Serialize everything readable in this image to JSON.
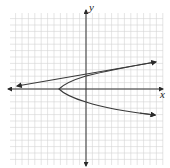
{
  "chart_data": {
    "type": "line",
    "title": "",
    "xlabel": "x",
    "ylabel": "y",
    "grid": true,
    "xlim": [
      -13,
      12
    ],
    "ylim": [
      -12,
      12
    ],
    "series": [
      {
        "name": "parabola",
        "equation": "x = y^2 - 4",
        "vertex": [
          -4,
          0
        ],
        "points": [
          [
            -4,
            0
          ],
          [
            -3,
            1
          ],
          [
            0,
            2
          ],
          [
            5,
            3
          ],
          [
            10.5,
            3.9
          ],
          [
            -3,
            -1
          ],
          [
            0,
            -2
          ],
          [
            5,
            -3
          ],
          [
            10.5,
            -4
          ]
        ]
      },
      {
        "name": "line",
        "points": [
          [
            -10.5,
            0.5
          ],
          [
            10.5,
            4.1
          ]
        ]
      }
    ],
    "axes": {
      "x_arrow": true,
      "y_arrow": true
    }
  },
  "labels": {
    "x_axis": "x",
    "y_axis": "y"
  },
  "colors": {
    "grid": "#d4d4d4",
    "axis": "#333333",
    "curve": "#3a3a3a"
  }
}
